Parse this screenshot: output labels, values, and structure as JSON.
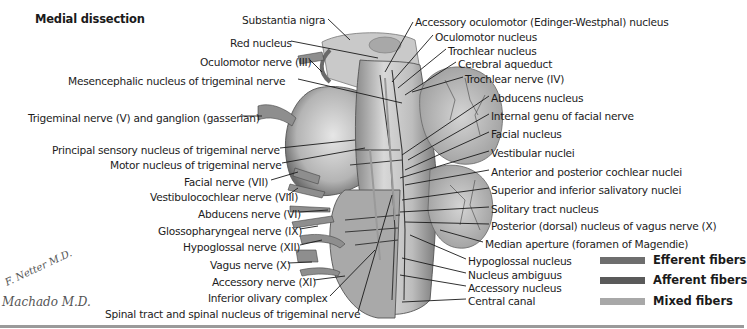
{
  "title": "Medial dissection",
  "labels_left": [
    {
      "text": "Substantia nigra",
      "x": 242,
      "y": 14
    },
    {
      "text": "Red nucleus",
      "x": 230,
      "y": 37
    },
    {
      "text": "Oculomotor nerve (III)",
      "x": 200,
      "y": 56
    },
    {
      "text": "Mesencephalic nucleus of trigeminal nerve",
      "x": 68,
      "y": 75
    },
    {
      "text": "Trigeminal nerve (V) and ganglion (gasserian)",
      "x": 28,
      "y": 112
    },
    {
      "text": "Principal sensory nucleus of trigeminal nerve",
      "x": 52,
      "y": 144
    },
    {
      "text": "Motor nucleus of trigeminal nerve",
      "x": 110,
      "y": 159
    },
    {
      "text": "Facial nerve (VII)",
      "x": 184,
      "y": 176
    },
    {
      "text": "Vestibulocochlear nerve (VIII)",
      "x": 150,
      "y": 191
    },
    {
      "text": "Abducens nerve (VI)",
      "x": 198,
      "y": 208
    },
    {
      "text": "Glossopharyngeal nerve (IX)",
      "x": 158,
      "y": 225
    },
    {
      "text": "Hypoglossal nerve (XII)",
      "x": 183,
      "y": 241
    },
    {
      "text": "Vagus nerve (X)",
      "x": 210,
      "y": 259
    },
    {
      "text": "Accessory nerve (XI)",
      "x": 212,
      "y": 276
    },
    {
      "text": "Inferior olivary complex",
      "x": 208,
      "y": 292
    },
    {
      "text": "Spinal tract and spinal nucleus of trigeminal nerve",
      "x": 105,
      "y": 308
    }
  ],
  "labels_right": [
    {
      "text": "Accessory oculomotor (Edinger-Westphal) nucleus",
      "x": 415,
      "y": 16
    },
    {
      "text": "Oculomotor nucleus",
      "x": 435,
      "y": 31
    },
    {
      "text": "Trochlear nucleus",
      "x": 448,
      "y": 45
    },
    {
      "text": "Cerebral aqueduct",
      "x": 458,
      "y": 58
    },
    {
      "text": "Trochlear nerve (IV)",
      "x": 465,
      "y": 73
    },
    {
      "text": "Abducens nucleus",
      "x": 491,
      "y": 92
    },
    {
      "text": "Internal genu of facial nerve",
      "x": 491,
      "y": 110
    },
    {
      "text": "Facial nucleus",
      "x": 491,
      "y": 128
    },
    {
      "text": "Vestibular nuclei",
      "x": 491,
      "y": 147
    },
    {
      "text": "Anterior and posterior cochlear nuclei",
      "x": 491,
      "y": 166
    },
    {
      "text": "Superior and inferior salivatory nuclei",
      "x": 491,
      "y": 184
    },
    {
      "text": "Solitary tract nucleus",
      "x": 491,
      "y": 203
    },
    {
      "text": "Posterior (dorsal) nucleus of vagus nerve (X)",
      "x": 491,
      "y": 220
    },
    {
      "text": "Median aperture (foramen of Magendie)",
      "x": 485,
      "y": 238
    },
    {
      "text": "Hypoglossal nucleus",
      "x": 468,
      "y": 255
    },
    {
      "text": "Nucleus ambiguus",
      "x": 468,
      "y": 269
    },
    {
      "text": "Accessory nucleus",
      "x": 468,
      "y": 282
    },
    {
      "text": "Central canal",
      "x": 468,
      "y": 295
    }
  ],
  "legend": [
    {
      "label": "Efferent fibers",
      "color": "#6e6e6e",
      "y": 258
    },
    {
      "label": "Afferent fibers",
      "color": "#5a5a5a",
      "y": 278
    },
    {
      "label": "Mixed fibers",
      "color": "#a8a8a8",
      "y": 299
    }
  ],
  "signatures": {
    "netter": "F. Netter M.D.",
    "machado": "Machado M.D."
  }
}
